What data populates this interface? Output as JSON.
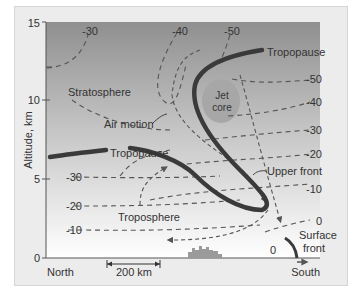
{
  "figure": {
    "y_axis": {
      "label": "Altitude, km",
      "ticks": [
        "0",
        "5",
        "10",
        "15"
      ]
    },
    "x_axis": {
      "left_label": "North",
      "right_label": "South",
      "scale_bar": "200 km"
    },
    "regions": {
      "stratosphere": "Stratosphere",
      "troposphere": "Troposphere"
    },
    "features": {
      "tropopause_upper": "Tropopause",
      "tropopause_lower": "Tropopause",
      "jet_core_line1": "Jet",
      "jet_core_line2": "core",
      "air_motion": "Air motion",
      "upper_front": "Upper front",
      "surface_front_line1": "Surface",
      "surface_front_line2": "front"
    },
    "isotherm_labels": {
      "top_left": "-30",
      "top_mid": "-40",
      "top_right": "-50",
      "right": [
        "-50",
        "-40",
        "-30",
        "-20",
        "-10",
        "0"
      ],
      "left": [
        "-30",
        "-20",
        "-10"
      ],
      "bottom_zero": "0"
    },
    "colors": {
      "gradient_top": "#8f8f8f",
      "gradient_bottom": "#ffffff",
      "jet_core_fill": "#a7a7a7",
      "front_line": "#3a3a3a",
      "dashed_line": "#555555"
    }
  }
}
